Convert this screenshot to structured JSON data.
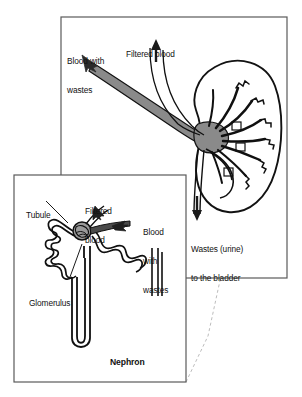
{
  "figure": {
    "title_caption": "",
    "background_color": "#ffffff",
    "ink_color": "#000000",
    "vessel_fill_color": "#8a8a8a",
    "frame_color": "#4a4a4a",
    "dash_color": "#b0b0b0"
  },
  "main_panel": {
    "name": "kidney-overview-panel",
    "frame": {
      "x": 61,
      "y": 17,
      "width": 226,
      "height": 261
    },
    "labels": [
      {
        "id": "blood-with-wastes",
        "text": "Blood with\nwastes",
        "line1": "Blood with",
        "line2": "wastes",
        "x": 67,
        "y": 38,
        "align": "left"
      },
      {
        "id": "filtered-blood",
        "text": "Filtered blood",
        "line1": "Filtered blood",
        "line2": "",
        "x": 126,
        "y": 31,
        "align": "left"
      },
      {
        "id": "wastes-urine-to-bladder",
        "text": "Wastes (urine)\nto the bladder",
        "line1": "Wastes (urine)",
        "line2": "to the bladder",
        "x": 191,
        "y": 226,
        "align": "left"
      }
    ],
    "arrows": [
      {
        "id": "incoming-blood-arrow",
        "direction": "down-right",
        "meaning": "blood with wastes enters kidney"
      },
      {
        "id": "filtered-blood-arrow",
        "direction": "up",
        "meaning": "filtered blood leaves kidney"
      },
      {
        "id": "urine-outflow-arrow",
        "direction": "down",
        "meaning": "urine travels to bladder"
      }
    ],
    "organ": {
      "id": "kidney",
      "shape": "bean",
      "description": "kidney with renal artery, renal vein and ureter"
    }
  },
  "inset_panel": {
    "name": "nephron-detail-panel",
    "frame": {
      "x": 14,
      "y": 175,
      "width": 172,
      "height": 207
    },
    "caption": "Nephron",
    "labels": [
      {
        "id": "tubule",
        "text": "Tubule",
        "line1": "Tubule",
        "line2": "",
        "x": 26,
        "y": 192,
        "align": "left"
      },
      {
        "id": "filtered-blood-inset",
        "text": "Filtered\nblood",
        "line1": "Filtered",
        "line2": "blood",
        "x": 85,
        "y": 188,
        "align": "left"
      },
      {
        "id": "blood-with-wastes-inset",
        "text": "Blood\nwith\nwastes",
        "line1": "Blood",
        "line2": "with",
        "line3": "wastes",
        "x": 143,
        "y": 209,
        "align": "left"
      },
      {
        "id": "glomerulus",
        "text": "Glomerulus",
        "line1": "Glomerulus",
        "line2": "",
        "x": 29,
        "y": 280,
        "align": "left"
      }
    ],
    "arrows": [
      {
        "id": "nephron-filtered-blood-arrow",
        "direction": "up-left",
        "meaning": "filtered blood exits glomerulus"
      },
      {
        "id": "nephron-blood-with-wastes-arrow",
        "direction": "left",
        "meaning": "blood with wastes enters glomerulus"
      }
    ],
    "leader_lines": [
      {
        "id": "tubule-leader",
        "from_label": "tubule"
      },
      {
        "id": "glomerulus-leader",
        "from_label": "glomerulus"
      }
    ]
  },
  "callout": {
    "name": "zoom-callout-connector",
    "style": "dashed",
    "description": "dashed lines linking the nephron inset to its location inside the kidney"
  }
}
